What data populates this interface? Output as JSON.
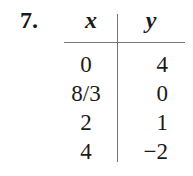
{
  "problem": {
    "number": "7.",
    "table": {
      "headers": {
        "x": "x",
        "y": "y"
      },
      "rows": [
        {
          "x": "0",
          "y": "4"
        },
        {
          "x": "8/3",
          "y": "0"
        },
        {
          "x": "2",
          "y": "1"
        },
        {
          "x": "4",
          "y": "−2"
        }
      ]
    }
  }
}
